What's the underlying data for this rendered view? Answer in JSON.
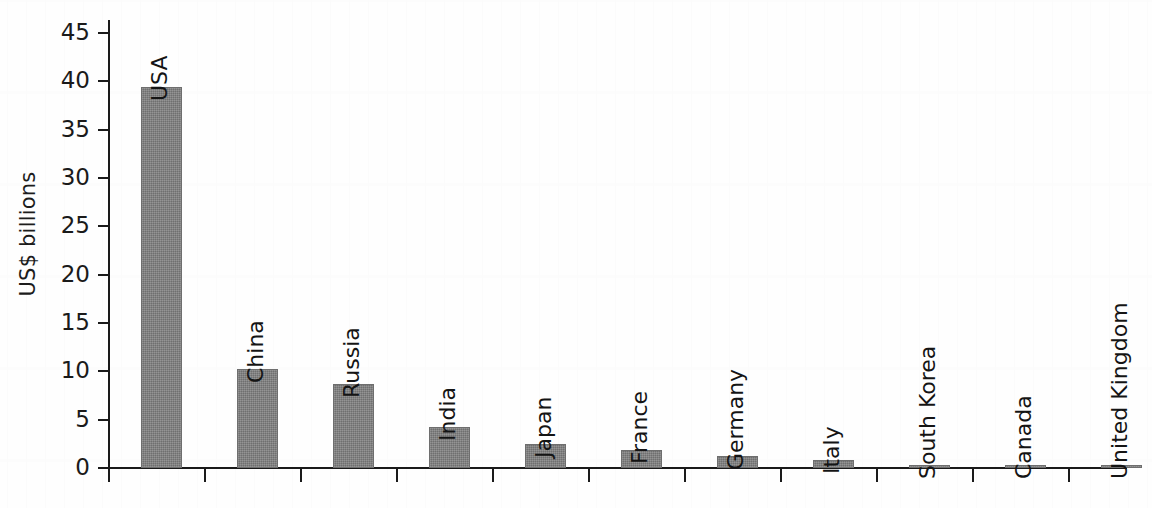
{
  "chart_data": {
    "type": "bar",
    "title": "",
    "subtitle": "",
    "xlabel": "",
    "ylabel": "US$ billions",
    "ylim": [
      0,
      45
    ],
    "yticks": [
      0,
      5,
      10,
      15,
      20,
      25,
      30,
      35,
      40,
      45
    ],
    "ytick_labels": [
      "0",
      "5",
      "10",
      "15",
      "20",
      "25",
      "30",
      "35",
      "40",
      "45"
    ],
    "grid": false,
    "legend": false,
    "legend_position": "none",
    "bar_color": "#7b7b7b",
    "axis_color": "#1a1a1a",
    "label_orientation": "vertical",
    "categories": [
      "USA",
      "China",
      "Russia",
      "India",
      "Japan",
      "France",
      "Germany",
      "Italy",
      "South Korea",
      "Canada",
      "United Kingdom"
    ],
    "values": [
      39.4,
      10.2,
      8.7,
      4.2,
      2.5,
      1.9,
      1.2,
      0.8,
      0.25,
      0.2,
      0.1
    ]
  }
}
